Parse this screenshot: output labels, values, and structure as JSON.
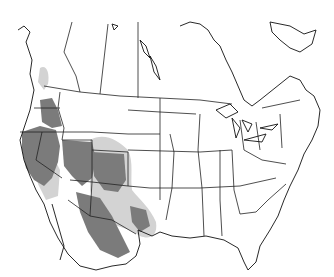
{
  "map": {
    "title": "",
    "region": "North America (Canada, United States, Mexico)",
    "type": "species range map",
    "legend": [],
    "colors": {
      "background": "#ffffff",
      "border_lines": "#222222",
      "range_primary": "#7b7b7b",
      "range_secondary": "#d3d3d3"
    },
    "range_areas": [
      {
        "name": "primary-range",
        "shade": "dark grey",
        "extent": "California, Nevada, Utah, Arizona, New Mexico, western Oregon/Idaho, northwestern Mexico"
      },
      {
        "name": "secondary-range",
        "shade": "light grey",
        "extent": "Colorado, western Texas, northern Mexico, southern British Columbia coast"
      }
    ]
  }
}
